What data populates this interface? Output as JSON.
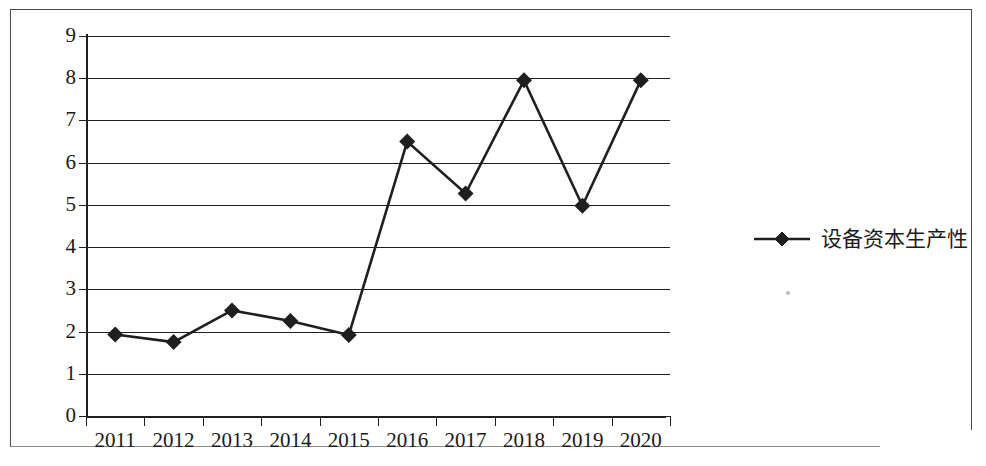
{
  "chart_data": {
    "type": "line",
    "title": "",
    "subtitle": "",
    "xlabel": "",
    "ylabel": "",
    "categories": [
      "2011",
      "2012",
      "2013",
      "2014",
      "2015",
      "2016",
      "2017",
      "2018",
      "2019",
      "2020"
    ],
    "series": [
      {
        "name": "设备资本生产性",
        "marker": "diamond",
        "color": "#1f1f1f",
        "values": [
          1.93,
          1.75,
          2.5,
          2.25,
          1.92,
          6.5,
          5.27,
          7.95,
          4.98,
          7.95
        ]
      }
    ],
    "ylim": [
      0,
      9
    ],
    "y_ticks": [
      "0",
      "1",
      "2",
      "3",
      "4",
      "5",
      "6",
      "7",
      "8",
      "9"
    ],
    "x_tick_labels": [
      "2011",
      "2012",
      "2013",
      "2014",
      "2015",
      "2016",
      "2017",
      "2018",
      "2019",
      "2020"
    ],
    "grid": "horizontal",
    "legend_position": "right",
    "legend_entries": [
      "设备资本生产性"
    ]
  },
  "legend": {
    "label": "设备资本生产性",
    "marker_icon": "diamond-marker-icon",
    "line_color": "#1f1f1f"
  },
  "axes": {
    "y_label_0": "0",
    "y_label_1": "1",
    "y_label_2": "2",
    "y_label_3": "3",
    "y_label_4": "4",
    "y_label_5": "5",
    "y_label_6": "6",
    "y_label_7": "7",
    "y_label_8": "8",
    "y_label_9": "9"
  },
  "colors": {
    "line": "#1f1f1f",
    "grid": "#1f1f1f",
    "frame": "#4a4a4a",
    "background": "#ffffff"
  }
}
